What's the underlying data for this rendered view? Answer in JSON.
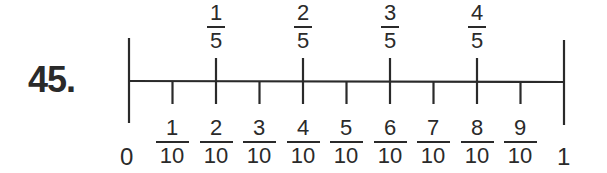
{
  "problem": {
    "number": "45."
  },
  "number_line": {
    "start_label": "0",
    "end_label": "1",
    "fifths": [
      {
        "num": "1",
        "den": "5"
      },
      {
        "num": "2",
        "den": "5"
      },
      {
        "num": "3",
        "den": "5"
      },
      {
        "num": "4",
        "den": "5"
      }
    ],
    "tenths": [
      {
        "num": "1",
        "den": "10"
      },
      {
        "num": "2",
        "den": "10"
      },
      {
        "num": "3",
        "den": "10"
      },
      {
        "num": "4",
        "den": "10"
      },
      {
        "num": "5",
        "den": "10"
      },
      {
        "num": "6",
        "den": "10"
      },
      {
        "num": "7",
        "den": "10"
      },
      {
        "num": "8",
        "den": "10"
      },
      {
        "num": "9",
        "den": "10"
      }
    ],
    "line_color": "#2a2a2a"
  }
}
